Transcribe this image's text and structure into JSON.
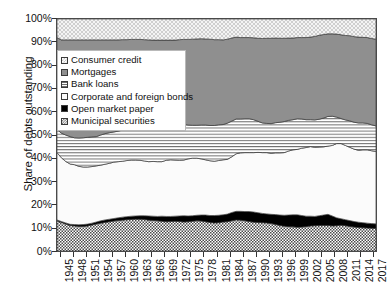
{
  "chart_data": {
    "type": "area",
    "stacked": true,
    "normalized": true,
    "title": "",
    "xlabel": "",
    "ylabel": "Share of debts outstanding",
    "ylim": [
      0,
      100
    ],
    "ytick_labels": [
      "0%",
      "10%",
      "20%",
      "30%",
      "40%",
      "50%",
      "60%",
      "70%",
      "80%",
      "90%",
      "100%"
    ],
    "ytick_values": [
      0,
      10,
      20,
      30,
      40,
      50,
      60,
      70,
      80,
      90,
      100
    ],
    "grid": false,
    "legend_position": "upper-left-inside",
    "xlim": [
      1945,
      2018
    ],
    "xtick_labels": [
      "1945",
      "1948",
      "1951",
      "1954",
      "1957",
      "1960",
      "1963",
      "1966",
      "1969",
      "1972",
      "1975",
      "1978",
      "1981",
      "1984",
      "1987",
      "1990",
      "1993",
      "1996",
      "1999",
      "2002",
      "2005",
      "2008",
      "2011",
      "2014",
      "2017"
    ],
    "x": [
      1945,
      1946,
      1947,
      1948,
      1949,
      1950,
      1951,
      1952,
      1953,
      1954,
      1955,
      1956,
      1957,
      1958,
      1959,
      1960,
      1961,
      1962,
      1963,
      1964,
      1965,
      1966,
      1967,
      1968,
      1969,
      1970,
      1971,
      1972,
      1973,
      1974,
      1975,
      1976,
      1977,
      1978,
      1979,
      1980,
      1981,
      1982,
      1983,
      1984,
      1985,
      1986,
      1987,
      1988,
      1989,
      1990,
      1991,
      1992,
      1993,
      1994,
      1995,
      1996,
      1997,
      1998,
      1999,
      2000,
      2001,
      2002,
      2003,
      2004,
      2005,
      2006,
      2007,
      2008,
      2009,
      2010,
      2011,
      2012,
      2013,
      2014,
      2015,
      2016,
      2017,
      2018
    ],
    "series": [
      {
        "name": "Municipal securities",
        "fill": "fine-checkerboard",
        "color": "#ffffff",
        "values": [
          13.0,
          12.3,
          11.6,
          11.0,
          10.8,
          10.6,
          10.6,
          10.8,
          11.2,
          11.6,
          12.0,
          12.3,
          12.6,
          12.9,
          13.1,
          13.3,
          13.5,
          13.6,
          13.7,
          13.7,
          13.6,
          13.3,
          13.2,
          13.0,
          12.8,
          12.6,
          12.7,
          12.8,
          12.7,
          12.5,
          12.6,
          12.8,
          13.0,
          12.9,
          12.6,
          12.3,
          12.1,
          12.2,
          12.5,
          12.6,
          13.0,
          13.4,
          13.3,
          13.0,
          12.7,
          12.4,
          12.3,
          12.2,
          12.1,
          11.8,
          11.4,
          11.0,
          10.7,
          10.5,
          10.4,
          10.2,
          10.3,
          10.5,
          10.8,
          10.9,
          11.0,
          11.0,
          11.0,
          10.8,
          10.9,
          11.1,
          10.9,
          10.6,
          10.3,
          10.1,
          10.0,
          9.9,
          9.8,
          9.7
        ]
      },
      {
        "name": "Open market paper",
        "fill": "solid-black",
        "color": "#000000",
        "values": [
          0.4,
          0.4,
          0.5,
          0.5,
          0.6,
          0.7,
          0.8,
          0.8,
          0.8,
          0.9,
          1.0,
          1.1,
          1.1,
          1.1,
          1.2,
          1.3,
          1.3,
          1.4,
          1.4,
          1.5,
          1.6,
          1.8,
          1.8,
          1.9,
          2.2,
          2.3,
          2.2,
          2.2,
          2.4,
          2.7,
          2.5,
          2.4,
          2.4,
          2.6,
          2.9,
          3.0,
          3.2,
          3.2,
          3.1,
          3.3,
          3.6,
          3.7,
          3.8,
          4.0,
          4.3,
          4.4,
          4.2,
          4.0,
          3.9,
          4.0,
          4.3,
          4.5,
          4.7,
          5.0,
          5.2,
          5.4,
          5.0,
          4.5,
          4.2,
          4.0,
          4.2,
          4.5,
          4.8,
          4.3,
          3.4,
          2.8,
          2.6,
          2.5,
          2.4,
          2.3,
          2.2,
          2.1,
          2.0,
          2.0
        ]
      },
      {
        "name": "Corporate and foreign bonds",
        "fill": "near-white",
        "color": "#fbfbfb",
        "values": [
          29.0,
          27.5,
          26.5,
          26.0,
          25.8,
          25.2,
          24.8,
          24.6,
          24.4,
          24.2,
          24.0,
          24.0,
          24.1,
          24.3,
          24.2,
          24.1,
          24.2,
          24.2,
          24.1,
          23.9,
          23.6,
          23.4,
          23.6,
          23.6,
          23.5,
          24.2,
          24.4,
          24.2,
          24.0,
          24.0,
          24.6,
          24.8,
          24.6,
          24.2,
          23.8,
          23.6,
          23.4,
          23.6,
          23.7,
          23.6,
          24.0,
          24.8,
          25.2,
          25.4,
          25.4,
          25.6,
          26.0,
          26.2,
          26.4,
          26.3,
          26.6,
          26.8,
          27.0,
          27.6,
          28.0,
          28.2,
          29.0,
          29.6,
          30.0,
          29.8,
          29.6,
          29.4,
          29.4,
          30.4,
          32.0,
          32.4,
          32.0,
          31.6,
          31.2,
          31.0,
          31.4,
          31.6,
          31.4,
          31.2
        ]
      },
      {
        "name": "Bank loans",
        "fill": "horizontal-hatch",
        "color": "#ffffff",
        "values": [
          10.0,
          10.6,
          11.4,
          11.8,
          11.6,
          12.2,
          12.6,
          12.8,
          12.8,
          12.6,
          13.0,
          13.2,
          13.2,
          13.0,
          13.2,
          13.4,
          13.4,
          13.6,
          13.8,
          14.0,
          14.4,
          14.6,
          14.4,
          14.6,
          14.8,
          14.4,
          14.2,
          14.4,
          15.0,
          15.4,
          14.6,
          14.2,
          14.2,
          14.6,
          15.0,
          15.2,
          15.4,
          15.4,
          15.2,
          15.6,
          15.4,
          15.0,
          14.6,
          14.6,
          14.6,
          14.2,
          13.4,
          12.8,
          12.6,
          12.8,
          13.0,
          13.2,
          13.4,
          13.2,
          13.0,
          13.2,
          12.6,
          12.0,
          11.6,
          11.8,
          12.0,
          12.4,
          12.8,
          12.6,
          11.4,
          10.8,
          11.0,
          11.4,
          11.6,
          11.8,
          11.6,
          11.4,
          11.2,
          11.0
        ]
      },
      {
        "name": "Mortgages",
        "fill": "solid-gray",
        "color": "#8f8f8f",
        "values": [
          39.6,
          40.2,
          41.0,
          41.7,
          42.2,
          42.3,
          42.2,
          42.0,
          41.8,
          41.7,
          41.0,
          40.4,
          40.0,
          39.7,
          39.3,
          39.0,
          38.7,
          38.4,
          38.2,
          38.1,
          37.9,
          37.9,
          37.9,
          37.8,
          37.6,
          37.4,
          37.4,
          37.3,
          37.0,
          36.6,
          36.9,
          37.1,
          37.2,
          37.2,
          37.1,
          37.2,
          37.0,
          36.7,
          36.5,
          36.2,
          35.8,
          35.3,
          35.1,
          35.0,
          35.0,
          35.3,
          35.8,
          36.4,
          36.7,
          36.8,
          36.5,
          36.2,
          35.9,
          35.5,
          35.2,
          35.0,
          35.1,
          35.4,
          35.6,
          36.0,
          36.2,
          36.0,
          35.6,
          35.5,
          35.8,
          36.1,
          36.4,
          36.7,
          36.9,
          37.0,
          36.9,
          37.0,
          37.2,
          37.4
        ]
      },
      {
        "name": "Consumer credit",
        "fill": "light-crosshatch",
        "color": "#e6e6e6",
        "values": [
          8.0,
          9.0,
          9.0,
          9.0,
          9.0,
          9.0,
          9.0,
          9.0,
          9.0,
          9.0,
          9.0,
          9.0,
          9.0,
          9.0,
          9.0,
          8.9,
          8.9,
          8.8,
          8.8,
          8.8,
          8.9,
          9.0,
          9.1,
          9.1,
          9.1,
          9.1,
          9.1,
          9.1,
          8.9,
          8.8,
          8.8,
          8.7,
          8.6,
          8.5,
          8.6,
          8.7,
          8.9,
          8.9,
          9.0,
          8.7,
          8.2,
          7.8,
          8.0,
          8.0,
          8.0,
          8.1,
          8.3,
          8.4,
          8.3,
          8.3,
          8.2,
          8.3,
          8.3,
          8.2,
          8.2,
          8.0,
          8.0,
          8.0,
          7.8,
          7.5,
          7.0,
          6.7,
          6.4,
          6.4,
          6.5,
          6.8,
          7.1,
          7.2,
          7.6,
          7.8,
          7.9,
          8.0,
          8.4,
          8.7
        ]
      }
    ]
  },
  "axes": {
    "y_title": "Share of debts outstanding",
    "y_ticks": [
      "100%",
      "90%",
      "80%",
      "70%",
      "60%",
      "50%",
      "40%",
      "30%",
      "20%",
      "10%",
      "0%"
    ],
    "x_ticks": [
      "1945",
      "1948",
      "1951",
      "1954",
      "1957",
      "1960",
      "1963",
      "1966",
      "1969",
      "1972",
      "1975",
      "1978",
      "1981",
      "1984",
      "1987",
      "1990",
      "1993",
      "1996",
      "1999",
      "2002",
      "2005",
      "2008",
      "2011",
      "2014",
      "2017"
    ]
  },
  "legend": {
    "items": [
      {
        "label": "Consumer credit",
        "swatch": "consumer-credit-swatch"
      },
      {
        "label": "Mortgages",
        "swatch": "mortgages-swatch"
      },
      {
        "label": "Bank loans",
        "swatch": "bank-loans-swatch"
      },
      {
        "label": "Corporate and foreign bonds",
        "swatch": "corporate-bonds-swatch"
      },
      {
        "label": "Open market paper",
        "swatch": "open-market-paper-swatch"
      },
      {
        "label": "Municipal securities",
        "swatch": "municipal-securities-swatch"
      }
    ]
  }
}
